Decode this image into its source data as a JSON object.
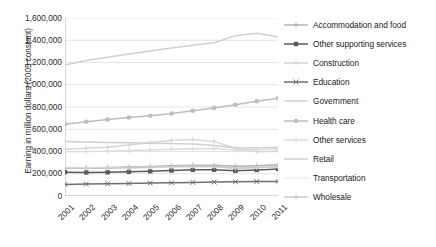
{
  "chart_data": {
    "type": "line",
    "title": "",
    "xlabel": "",
    "ylabel": "Earning in million dollars (2005 constant)",
    "x": [
      "2001",
      "2002",
      "2003",
      "2004",
      "2005",
      "2006",
      "2007",
      "2008",
      "2009",
      "2010",
      "2011"
    ],
    "ylim": [
      0,
      1600000
    ],
    "ytick_labels": [
      "1,600,000",
      "1,400,000",
      "1,200,000",
      "1,000,000",
      "800,000",
      "600,000",
      "400,000",
      "200,000",
      "0"
    ],
    "ytick_values": [
      1600000,
      1400000,
      1200000,
      1000000,
      800000,
      600000,
      400000,
      200000,
      0
    ],
    "grid": "horizontal",
    "legend_position": "right",
    "series": [
      {
        "name": "Accommodation and food",
        "color": "#b3b3b3",
        "marker": "plus",
        "values": [
          248000,
          252000,
          256000,
          261000,
          266000,
          271000,
          276000,
          276000,
          268000,
          272000,
          280000
        ]
      },
      {
        "name": "Other supporting services",
        "color": "#5a5a5a",
        "marker": "square",
        "values": [
          214000,
          212000,
          213000,
          217000,
          222000,
          229000,
          235000,
          236000,
          226000,
          234000,
          243000
        ]
      },
      {
        "name": "Construction",
        "color": "#d6d6d6",
        "marker": "plus",
        "values": [
          421000,
          430000,
          438000,
          458000,
          480000,
          500000,
          508000,
          491000,
          430000,
          398000,
          402000
        ]
      },
      {
        "name": "Education",
        "color": "#6e6e6e",
        "marker": "x",
        "values": [
          104000,
          107000,
          110000,
          113000,
          116000,
          119000,
          122000,
          126000,
          128000,
          130000,
          131000
        ]
      },
      {
        "name": "Government",
        "color": "#d0d0d0",
        "marker": "none",
        "values": [
          1178000,
          1218000,
          1248000,
          1277000,
          1303000,
          1330000,
          1355000,
          1378000,
          1440000,
          1462000,
          1432000
        ]
      },
      {
        "name": "Health care",
        "color": "#bdbdbd",
        "marker": "circle",
        "values": [
          645000,
          668000,
          688000,
          706000,
          722000,
          742000,
          766000,
          792000,
          820000,
          852000,
          878000
        ]
      },
      {
        "name": "Other services",
        "color": "#dcdcdc",
        "marker": "plus",
        "values": [
          398000,
          400000,
          403000,
          408000,
          414000,
          420000,
          425000,
          428000,
          412000,
          416000,
          422000
        ]
      },
      {
        "name": "Retail",
        "color": "#cfcfcf",
        "marker": "none",
        "values": [
          489000,
          485000,
          480000,
          478000,
          475000,
          472000,
          468000,
          455000,
          432000,
          434000,
          438000
        ]
      },
      {
        "name": "Transportation",
        "color": "#efefef",
        "marker": "none",
        "values": [
          258000,
          254000,
          252000,
          255000,
          259000,
          262000,
          265000,
          262000,
          247000,
          252000,
          258000
        ]
      },
      {
        "name": "Wholesale",
        "color": "#c8c8c8",
        "marker": "plus",
        "values": [
          252000,
          250000,
          249000,
          253000,
          258000,
          263000,
          268000,
          266000,
          250000,
          256000,
          264000
        ]
      }
    ]
  },
  "axis": {
    "y_title": "Earning in million dollars (2005 constant)"
  },
  "colors": {
    "axis_line": "#a6a6a6",
    "grid_line": "#d9d9d9",
    "text": "#2b2b2b",
    "background": "#ffffff"
  }
}
